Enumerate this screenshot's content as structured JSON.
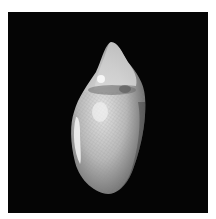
{
  "image": {
    "subject": "shell",
    "description": "Photograph of a single cone-shaped sea shell with fine reticulated pattern on a black background",
    "background_color": "#050505",
    "border_color": "#ffffff",
    "shell_colors": {
      "highlight": "#f2f2f2",
      "body": "#bdbdbd",
      "shadow": "#6e6e6e"
    }
  }
}
